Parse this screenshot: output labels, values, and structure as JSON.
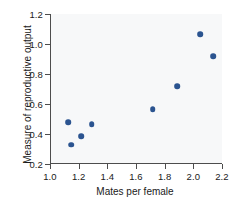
{
  "chart_data": {
    "type": "scatter",
    "title": "",
    "xlabel": "Mates per female",
    "ylabel": "Measure of reproductive output",
    "xlim": [
      1.0,
      2.2
    ],
    "ylim": [
      0.2,
      1.2
    ],
    "xticks": [
      "1.0",
      "1.2",
      "1.4",
      "1.6",
      "1.8",
      "2.0",
      "2.2"
    ],
    "xtick_values": [
      1.0,
      1.2,
      1.4,
      1.6,
      1.8,
      2.0,
      2.2
    ],
    "yticks": [
      "0.2",
      "0.4",
      "0.6",
      "0.8",
      "1.0",
      "1.2"
    ],
    "ytick_values": [
      0.2,
      0.4,
      0.6,
      0.8,
      1.0,
      1.2
    ],
    "grid": false,
    "legend": null,
    "marker_color": "#2b5490",
    "plot_background": "#f7f8f9",
    "axis_color": "#4d4d4d",
    "points": [
      {
        "x": 1.12,
        "y": 0.48
      },
      {
        "x": 1.14,
        "y": 0.33
      },
      {
        "x": 1.21,
        "y": 0.385
      },
      {
        "x": 1.285,
        "y": 0.465
      },
      {
        "x": 1.71,
        "y": 0.565
      },
      {
        "x": 1.88,
        "y": 0.72
      },
      {
        "x": 2.04,
        "y": 1.065
      },
      {
        "x": 2.13,
        "y": 0.92
      }
    ]
  }
}
